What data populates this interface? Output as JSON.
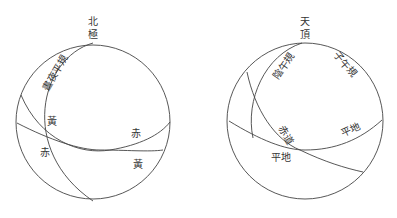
{
  "left_diagram": {
    "title_top": "北",
    "title_bottom": "極",
    "labels": {
      "arc_label": "晝夜平規",
      "ecliptic_left": "黃",
      "equator_left": "赤",
      "equator_right": "赤",
      "ecliptic_right": "黃"
    }
  },
  "right_diagram": {
    "title_top": "天",
    "title_bottom": "頂",
    "labels": {
      "arc_label_left": "陰午規",
      "arc_label_right": "子午規",
      "equator": "赤道",
      "horizon_left": "平地",
      "horizon_right": "平地"
    }
  }
}
